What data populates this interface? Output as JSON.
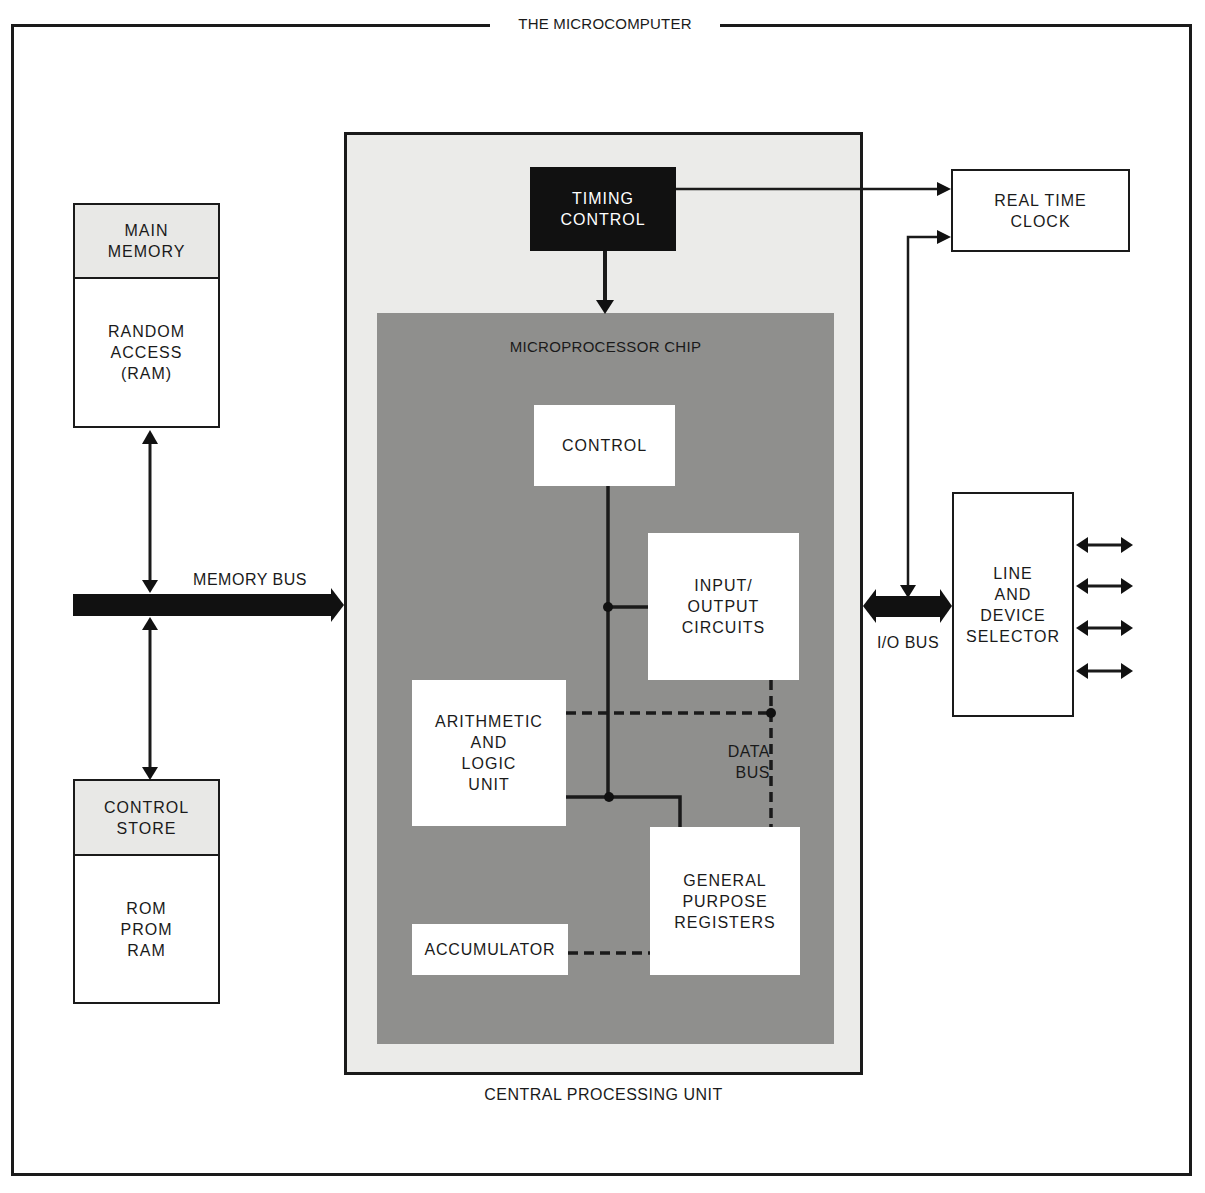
{
  "title": "THE MICROCOMPUTER",
  "colors": {
    "ink": "#1a1a1a",
    "cpu_fill": "#ebebe9",
    "chip_fill": "#8f8f8d",
    "timing_fill": "#111111",
    "memory_header_fill": "#e8e8e6"
  },
  "main_memory": {
    "header": "MAIN\nMEMORY",
    "body": "RANDOM\nACCESS\n(RAM)"
  },
  "control_store": {
    "header": "CONTROL\nSTORE",
    "body": "ROM\nPROM\nRAM"
  },
  "memory_bus": {
    "label": "MEMORY BUS"
  },
  "cpu": {
    "label": "CENTRAL PROCESSING UNIT",
    "timing_control": "TIMING\nCONTROL",
    "chip": {
      "label": "MICROPROCESSOR CHIP",
      "control": "CONTROL",
      "io_circuits": "INPUT/\nOUTPUT\nCIRCUITS",
      "alu": "ARITHMETIC\nAND\nLOGIC\nUNIT",
      "data_bus": "DATA\nBUS",
      "registers": "GENERAL\nPURPOSE\nREGISTERS",
      "accumulator": "ACCUMULATOR"
    }
  },
  "real_time_clock": {
    "label": "REAL TIME\nCLOCK"
  },
  "io_bus": {
    "label": "I/O BUS"
  },
  "line_device_selector": {
    "label": "LINE\nAND\nDEVICE\nSELECTOR",
    "outputs": 4
  }
}
